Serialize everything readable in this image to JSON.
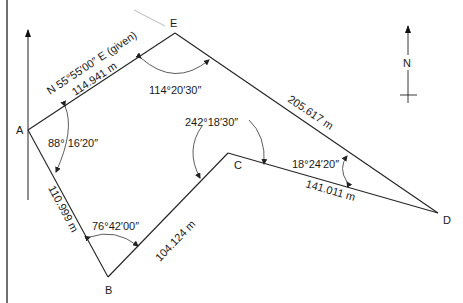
{
  "diagram": {
    "type": "closed traverse survey plot",
    "points": {
      "A": "A",
      "B": "B",
      "C": "C",
      "D": "D",
      "E": "E"
    },
    "edges": {
      "AE": {
        "length": "114.941 m",
        "bearing": "N 55°55′00″ E (given)"
      },
      "ED": {
        "length": "205.617 m"
      },
      "DC": {
        "length": "141.011 m"
      },
      "CB": {
        "length": "104.124 m"
      },
      "BA": {
        "length": "110.999 m"
      }
    },
    "angles": {
      "A": "88° 16′20″",
      "E": "114°20′30″",
      "C": "242°18′30″",
      "D": "18°24′20″",
      "B": "76°42′00″"
    },
    "north_arrow": {
      "label": "N"
    }
  }
}
